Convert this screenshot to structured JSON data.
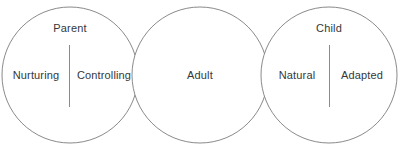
{
  "diagram": {
    "type": "three-overlapping-circles",
    "background_color": "#ffffff",
    "stroke_color": "#8a8a8a",
    "text_color": "#35373a",
    "circles": [
      {
        "id": "parent",
        "title": "Parent",
        "cx": 70,
        "cy": 75,
        "r": 68,
        "divider": {
          "x": 69.5,
          "y1": 45,
          "y2": 107
        },
        "sublabels": [
          {
            "id": "nurturing",
            "text": "Nurturing",
            "x": 36,
            "y": 75
          },
          {
            "id": "controlling",
            "text": "Controlling",
            "x": 104,
            "y": 75
          }
        ],
        "title_x": 70,
        "title_y": 28
      },
      {
        "id": "adult",
        "title": "Adult",
        "cx": 200,
        "cy": 75,
        "r": 68,
        "divider": null,
        "sublabels": [],
        "title_x": 200,
        "title_y": 75
      },
      {
        "id": "child",
        "title": "Child",
        "cx": 329,
        "cy": 75,
        "r": 68,
        "divider": {
          "x": 329.5,
          "y1": 45,
          "y2": 107
        },
        "sublabels": [
          {
            "id": "natural",
            "text": "Natural",
            "x": 297,
            "y": 75
          },
          {
            "id": "adapted",
            "text": "Adapted",
            "x": 362,
            "y": 75
          }
        ],
        "title_x": 329,
        "title_y": 28
      }
    ]
  }
}
